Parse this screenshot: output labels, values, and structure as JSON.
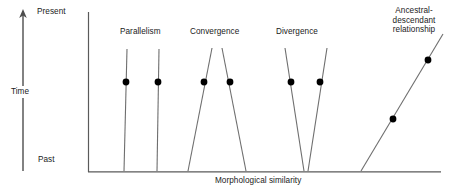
{
  "figure": {
    "axes": {
      "y_axis_name": "vertical-axis",
      "x_axis_name": "horizontal-axis",
      "x_axis_title": "Morphological similarity",
      "time_arrow_label": "Time",
      "time_top_label": "Present",
      "time_bottom_label": "Past"
    },
    "groups": [
      {
        "id": "parallelism",
        "label": "Parallelism",
        "label_x": 120,
        "label_y": 27,
        "lines": [
          {
            "x1": 127,
            "y1": 49,
            "x2": 124,
            "y2": 171
          },
          {
            "x1": 159,
            "y1": 49,
            "x2": 157,
            "y2": 171
          }
        ],
        "dots": [
          {
            "cx": 126,
            "cy": 82
          },
          {
            "cx": 158,
            "cy": 82
          }
        ]
      },
      {
        "id": "convergence",
        "label": "Convergence",
        "label_x": 190,
        "label_y": 27,
        "lines": [
          {
            "x1": 212,
            "y1": 48,
            "x2": 188,
            "y2": 171
          },
          {
            "x1": 222,
            "y1": 48,
            "x2": 246,
            "y2": 171
          }
        ],
        "dots": [
          {
            "cx": 204,
            "cy": 82
          },
          {
            "cx": 230,
            "cy": 82
          }
        ]
      },
      {
        "id": "divergence",
        "label": "Divergence",
        "label_x": 276,
        "label_y": 27,
        "lines": [
          {
            "x1": 285,
            "y1": 48,
            "x2": 304,
            "y2": 171
          },
          {
            "x1": 327,
            "y1": 48,
            "x2": 308,
            "y2": 171
          }
        ],
        "dots": [
          {
            "cx": 291,
            "cy": 82
          },
          {
            "cx": 320,
            "cy": 82
          }
        ]
      },
      {
        "id": "ancestral-descendant",
        "label": "Ancestral-\ndescendant\nrelationship",
        "label_x": 378,
        "label_y": 6,
        "lines": [
          {
            "x1": 443,
            "y1": 34,
            "x2": 361,
            "y2": 171
          }
        ],
        "dots": [
          {
            "cx": 428,
            "cy": 60
          },
          {
            "cx": 393,
            "cy": 119
          }
        ]
      }
    ],
    "colors": {
      "axis": "#4d4d4d",
      "line": "#6e6e6e",
      "dot": "#000000",
      "text": "#1a1a1a",
      "background": "#ffffff"
    }
  },
  "chart_data": {
    "type": "diagram",
    "title": "",
    "xlabel": "Morphological similarity",
    "ylabel": "Time",
    "y_tick_labels": [
      "Past",
      "Present"
    ],
    "annotations": [
      "Parallelism",
      "Convergence",
      "Divergence",
      "Ancestral-descendant relationship"
    ],
    "series": [
      {
        "name": "Parallelism",
        "lineages": 2,
        "description": "two lineages remain equally similar through time"
      },
      {
        "name": "Convergence",
        "lineages": 2,
        "description": "two lineages become more similar through time"
      },
      {
        "name": "Divergence",
        "lineages": 2,
        "description": "two lineages become less similar through time"
      },
      {
        "name": "Ancestral-descendant relationship",
        "lineages": 1,
        "description": "a single lineage changing in morphology through time"
      }
    ]
  }
}
